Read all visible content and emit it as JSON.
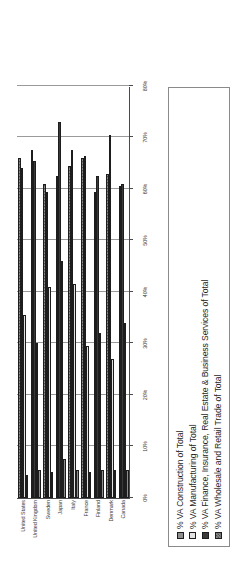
{
  "chart_data": {
    "type": "bar",
    "title": "",
    "subtitle": "",
    "xlabel": "",
    "ylabel": "",
    "orientation": "horizontal",
    "grid": true,
    "legend_position": "bottom",
    "axis_min": 0,
    "axis_max": 80,
    "axis_tick_labels": [
      "80%",
      "70%",
      "60%",
      "50%",
      "40%",
      "30%",
      "20%",
      "10%",
      "0%"
    ],
    "axis_tick_values": [
      80,
      70,
      60,
      50,
      40,
      30,
      20,
      10,
      0
    ],
    "categories": [
      "Canada",
      "Denmark",
      "Finland",
      "France",
      "Italy",
      "Japan",
      "Sweden",
      "United Kingdom",
      "United States"
    ],
    "series": [
      {
        "name": "% VA Construction of Total",
        "key": "construction",
        "color": "#8e8e8e",
        "values": [
          5.5,
          5.5,
          5.5,
          5.0,
          5.5,
          7.5,
          5.0,
          5.5,
          4.5
        ]
      },
      {
        "name": "% VA Manufacturing of Total",
        "key": "manufacturing",
        "color": "#e3e3e3",
        "values": [
          34.0,
          27.0,
          32.0,
          29.5,
          41.5,
          46.0,
          41.0,
          30.0,
          35.5
        ]
      },
      {
        "name": "% VA Finance, Insurance, Real Estate & Business Services of Total",
        "key": "finance",
        "color": "#3a3a3a",
        "values": [
          61.0,
          70.5,
          62.5,
          66.5,
          67.5,
          73.0,
          59.5,
          65.5,
          64.0
        ]
      },
      {
        "name": "% VA Wholesale and Retail Trade of Total",
        "key": "wholesale",
        "color": "#8b8b8b",
        "values": [
          60.5,
          63.0,
          59.5,
          66.0,
          64.5,
          62.5,
          61.0,
          67.5,
          66.0
        ]
      }
    ]
  },
  "legend": {
    "items": [
      {
        "label": "% VA Construction of Total",
        "swatch": "construction"
      },
      {
        "label": "% VA Manufacturing of Total",
        "swatch": "manufacturing"
      },
      {
        "label": "% VA Finance, Insurance, Real Estate & Business Services of Total",
        "swatch": "finance"
      },
      {
        "label": "% VA Wholesale and Retail Trade of Total",
        "swatch": "wholesale"
      }
    ]
  }
}
